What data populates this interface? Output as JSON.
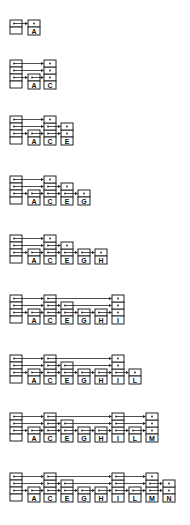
{
  "diagram": {
    "type": "skip-list-insertion-sequence",
    "cell_width": 12,
    "cell_height": 7,
    "node_spacing": 17,
    "header_x": 10,
    "stroke_color": "#222222",
    "background": "#ffffff",
    "steps": [
      {
        "y": 20,
        "header_levels": 1,
        "nodes": [
          {
            "key": "A",
            "levels": 1
          }
        ]
      },
      {
        "y": 60,
        "header_levels": 3,
        "nodes": [
          {
            "key": "A",
            "levels": 1
          },
          {
            "key": "C",
            "levels": 3
          }
        ]
      },
      {
        "y": 116,
        "header_levels": 3,
        "nodes": [
          {
            "key": "A",
            "levels": 1
          },
          {
            "key": "C",
            "levels": 3
          },
          {
            "key": "E",
            "levels": 2
          }
        ]
      },
      {
        "y": 176,
        "header_levels": 3,
        "nodes": [
          {
            "key": "A",
            "levels": 1
          },
          {
            "key": "C",
            "levels": 3
          },
          {
            "key": "E",
            "levels": 2
          },
          {
            "key": "G",
            "levels": 1
          }
        ]
      },
      {
        "y": 235,
        "header_levels": 3,
        "nodes": [
          {
            "key": "A",
            "levels": 1
          },
          {
            "key": "C",
            "levels": 3
          },
          {
            "key": "E",
            "levels": 2
          },
          {
            "key": "G",
            "levels": 1
          },
          {
            "key": "H",
            "levels": 1
          }
        ]
      },
      {
        "y": 295,
        "header_levels": 3,
        "nodes": [
          {
            "key": "A",
            "levels": 1
          },
          {
            "key": "C",
            "levels": 3
          },
          {
            "key": "E",
            "levels": 2
          },
          {
            "key": "G",
            "levels": 1
          },
          {
            "key": "H",
            "levels": 1
          },
          {
            "key": "I",
            "levels": 3
          }
        ]
      },
      {
        "y": 355,
        "header_levels": 3,
        "nodes": [
          {
            "key": "A",
            "levels": 1
          },
          {
            "key": "C",
            "levels": 3
          },
          {
            "key": "E",
            "levels": 2
          },
          {
            "key": "G",
            "levels": 1
          },
          {
            "key": "H",
            "levels": 1
          },
          {
            "key": "I",
            "levels": 3
          },
          {
            "key": "L",
            "levels": 1
          }
        ]
      },
      {
        "y": 413,
        "header_levels": 3,
        "nodes": [
          {
            "key": "A",
            "levels": 1
          },
          {
            "key": "C",
            "levels": 3
          },
          {
            "key": "E",
            "levels": 2
          },
          {
            "key": "G",
            "levels": 1
          },
          {
            "key": "H",
            "levels": 1
          },
          {
            "key": "I",
            "levels": 3
          },
          {
            "key": "L",
            "levels": 1
          },
          {
            "key": "M",
            "levels": 3
          }
        ]
      },
      {
        "y": 473,
        "header_levels": 3,
        "nodes": [
          {
            "key": "A",
            "levels": 1
          },
          {
            "key": "C",
            "levels": 3
          },
          {
            "key": "E",
            "levels": 2
          },
          {
            "key": "G",
            "levels": 1
          },
          {
            "key": "H",
            "levels": 1
          },
          {
            "key": "I",
            "levels": 3
          },
          {
            "key": "L",
            "levels": 1
          },
          {
            "key": "M",
            "levels": 3
          },
          {
            "key": "N",
            "levels": 2
          }
        ]
      }
    ]
  }
}
